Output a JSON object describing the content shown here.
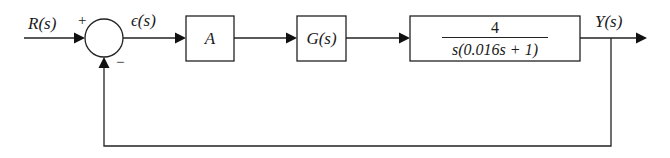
{
  "diagram": {
    "type": "block-diagram-feedback-loop",
    "input": {
      "label": "R(s)"
    },
    "summing_junction": {
      "plus_sign": "+",
      "minus_sign": "−"
    },
    "error": {
      "label": "ϵ(s)"
    },
    "blocks": [
      {
        "id": "gain",
        "label": "A"
      },
      {
        "id": "controller",
        "label": "G(s)"
      },
      {
        "id": "plant",
        "numerator": "4",
        "denominator": "s(0.016s + 1)"
      }
    ],
    "output": {
      "label": "Y(s)"
    },
    "feedback": {
      "type": "unity",
      "sign": "negative"
    },
    "colors": {
      "line": "#222222",
      "background": "#ffffff"
    }
  }
}
